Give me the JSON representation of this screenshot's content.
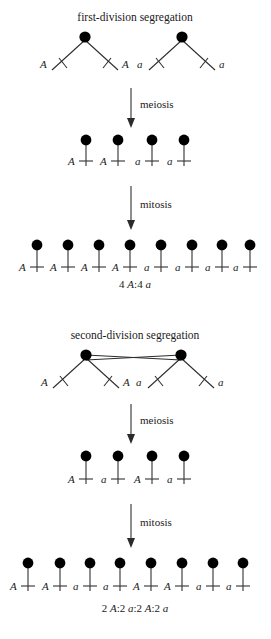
{
  "figure": {
    "background_color": "#ffffff",
    "ink_color": "#1a1a1a"
  },
  "panels": [
    {
      "id": "first-division",
      "title": "first-division segregation",
      "tetrad_labels": [
        "A",
        "A",
        "a",
        "a"
      ],
      "arrow_1_label": "meiosis",
      "meiosis_products": [
        "A",
        "A",
        "a",
        "a"
      ],
      "arrow_2_label": "mitosis",
      "mitosis_products": [
        "A",
        "A",
        "A",
        "A",
        "a",
        "a",
        "a",
        "a"
      ],
      "ratio": "4 A:4 a",
      "ratio_parts": [
        {
          "text": "4 ",
          "italic": false
        },
        {
          "text": "A",
          "italic": true
        },
        {
          "text": ":4 ",
          "italic": false
        },
        {
          "text": "a",
          "italic": true
        }
      ],
      "has_crossover": false
    },
    {
      "id": "second-division",
      "title": "second-division segregation",
      "tetrad_labels": [
        "A",
        "A",
        "a",
        "a"
      ],
      "arrow_1_label": "meiosis",
      "meiosis_products": [
        "A",
        "a",
        "A",
        "a"
      ],
      "arrow_2_label": "mitosis",
      "mitosis_products": [
        "A",
        "A",
        "a",
        "a",
        "A",
        "A",
        "a",
        "a"
      ],
      "ratio": "2 A:2 a:2 A:2 a",
      "ratio_parts": [
        {
          "text": "2 ",
          "italic": false
        },
        {
          "text": "A",
          "italic": true
        },
        {
          "text": ":2 ",
          "italic": false
        },
        {
          "text": "a",
          "italic": true
        },
        {
          "text": ":2 ",
          "italic": false
        },
        {
          "text": "A",
          "italic": true
        },
        {
          "text": ":2 ",
          "italic": false
        },
        {
          "text": "a",
          "italic": true
        }
      ],
      "has_crossover": true
    }
  ]
}
